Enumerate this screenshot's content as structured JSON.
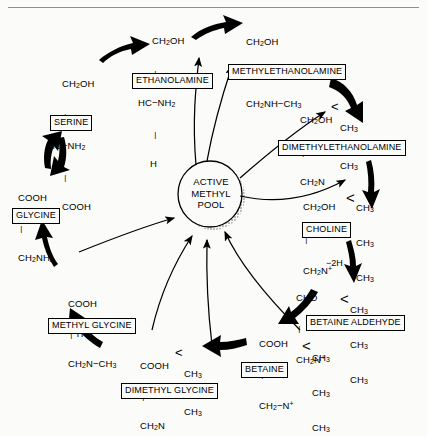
{
  "diagram": {
    "background_color": "#fbfbfa",
    "ink_color": "#000000",
    "rule_color": "#8e8e8e"
  },
  "center": {
    "label": "ACTIVE\nMETHYL\nPOOL"
  },
  "compounds": {
    "serine": {
      "name": "SERINE",
      "l1": "CH2OH",
      "l2": "HC−NH2",
      "l3": "COOH"
    },
    "glycine": {
      "name": "GLYCINE",
      "l1": "COOH",
      "l2": "CH2NH2"
    },
    "ethanolamine": {
      "name": "ETHANOLAMINE",
      "l1": "CH2OH",
      "l2": "HC−NH2",
      "l3": "H"
    },
    "methylethanolamine": {
      "name": "METHYLETHANOLAMINE",
      "l1": "CH2OH",
      "l2": "CH2NH−CH3"
    },
    "dimethylethanolamine": {
      "name": "DIMETHYLETHANOLAMINE",
      "l1": "CH2OH",
      "l2": "CH2N",
      "r1": "CH3",
      "r2": "CH3"
    },
    "choline": {
      "name": "CHOLINE",
      "l1": "CH2OH",
      "l2": "CH2N+",
      "r1": "CH3",
      "r2": "CH3",
      "r3": "CH3"
    },
    "betaine_aldehyde": {
      "name": "BETAINE  ALDEHYDE",
      "l1": "CHO",
      "l2": "CH2N+",
      "r1": "CH3",
      "r2": "CH3",
      "r3": "CH3"
    },
    "betaine": {
      "name": "BETAINE",
      "l1": "COOH",
      "l2": "CH2−N+",
      "r1": "CH3",
      "r2": "CH3",
      "r3": "CH3"
    },
    "dimethyl_glycine": {
      "name": "DIMETHYL  GLYCINE",
      "l1": "COOH",
      "l2": "CH2N",
      "r1": "CH3",
      "r2": "CH3"
    },
    "methyl_glycine": {
      "name": "METHYL  GLYCINE",
      "l1": "COOH",
      "l1b": "H",
      "l2": "CH2N−CH3"
    }
  },
  "annotations": {
    "dehydrogenation": "−2H"
  }
}
